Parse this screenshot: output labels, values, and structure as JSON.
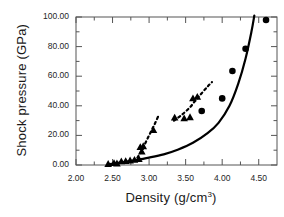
{
  "chart_data": {
    "type": "scatter",
    "title": "",
    "xlabel": "Density  (g/cm3)",
    "xlabel_base": "Density  (g/cm",
    "xlabel_sup": "3",
    "xlabel_tail": ")",
    "ylabel": "Shock pressure  (GPa)",
    "xlim": [
      2.0,
      4.75
    ],
    "ylim": [
      0.0,
      100.0
    ],
    "grid": false,
    "legend": "none",
    "xticks": [
      2.0,
      2.5,
      3.0,
      3.5,
      4.0,
      4.5
    ],
    "xtick_labels": [
      "2.00",
      "2.50",
      "3.00",
      "3.50",
      "4.00",
      "4.50"
    ],
    "yticks": [
      0.0,
      20.0,
      40.0,
      60.0,
      80.0,
      100.0
    ],
    "ytick_labels": [
      "0.00",
      "20.00",
      "40.00",
      "60.00",
      "80.00",
      "100.00"
    ],
    "minor_xticks": [
      2.25,
      2.75,
      3.25,
      3.75,
      4.25
    ],
    "minor_yticks": [
      10,
      30,
      50,
      70,
      90
    ],
    "series": [
      {
        "name": "triangles",
        "marker": "triangle",
        "color": "#000000",
        "points": [
          [
            2.44,
            0.6
          ],
          [
            2.52,
            1.2
          ],
          [
            2.56,
            1.0
          ],
          [
            2.62,
            2.4
          ],
          [
            2.68,
            2.6
          ],
          [
            2.74,
            3.0
          ],
          [
            2.8,
            3.4
          ],
          [
            2.86,
            4.0
          ],
          [
            2.9,
            9.0
          ],
          [
            2.88,
            12.0
          ],
          [
            2.92,
            12.6
          ],
          [
            3.06,
            23.5
          ],
          [
            3.35,
            32.0
          ],
          [
            3.48,
            31.5
          ],
          [
            3.56,
            32.2
          ],
          [
            3.6,
            45.0
          ],
          [
            3.66,
            46.0
          ]
        ]
      },
      {
        "name": "circles",
        "marker": "circle",
        "color": "#000000",
        "points": [
          [
            3.72,
            36.5
          ],
          [
            4.0,
            45.0
          ],
          [
            4.14,
            63.5
          ],
          [
            4.32,
            78.5
          ],
          [
            4.6,
            98.0
          ]
        ]
      }
    ],
    "curves": [
      {
        "name": "solid-curve",
        "style": "solid",
        "color": "#000000",
        "width": 2.2,
        "points": [
          [
            2.44,
            0.4
          ],
          [
            2.6,
            1.6
          ],
          [
            2.8,
            3.2
          ],
          [
            3.0,
            5.0
          ],
          [
            3.2,
            7.2
          ],
          [
            3.4,
            10.5
          ],
          [
            3.6,
            15.0
          ],
          [
            3.8,
            21.5
          ],
          [
            3.95,
            28.5
          ],
          [
            4.1,
            40.0
          ],
          [
            4.22,
            55.0
          ],
          [
            4.32,
            72.0
          ],
          [
            4.4,
            90.0
          ],
          [
            4.44,
            101.0
          ]
        ]
      },
      {
        "name": "dashed-curve-lower",
        "style": "dashed",
        "color": "#000000",
        "width": 2.2,
        "points": [
          [
            2.84,
            5.0
          ],
          [
            2.9,
            10.0
          ],
          [
            2.96,
            16.0
          ],
          [
            3.02,
            22.0
          ],
          [
            3.08,
            28.0
          ],
          [
            3.13,
            33.5
          ]
        ]
      },
      {
        "name": "dashed-curve-upper",
        "style": "dashed",
        "color": "#000000",
        "width": 2.2,
        "points": [
          [
            3.34,
            30.0
          ],
          [
            3.45,
            34.0
          ],
          [
            3.56,
            39.0
          ],
          [
            3.64,
            44.0
          ],
          [
            3.72,
            48.5
          ],
          [
            3.8,
            53.0
          ],
          [
            3.86,
            56.0
          ]
        ]
      }
    ]
  }
}
